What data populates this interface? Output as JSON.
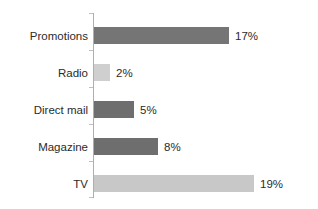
{
  "chart_data": {
    "type": "bar",
    "orientation": "horizontal",
    "title": "",
    "subtitle": "",
    "xlabel": "",
    "ylabel": "",
    "grid": false,
    "legend": "none",
    "xlim": [
      0,
      19
    ],
    "value_suffix": "%",
    "categories": [
      "Promotions",
      "Radio",
      "Direct mail",
      "Magazine",
      "TV"
    ],
    "values": [
      17,
      2,
      5,
      8,
      19
    ],
    "value_labels": [
      "17%",
      "2%",
      "5%",
      "8%",
      "19%"
    ],
    "bar_colors": [
      "#757575",
      "#cfcfcf",
      "#6e6e6e",
      "#6e6e6e",
      "#c8c8c8"
    ],
    "bars": [
      {
        "category": "Promotions",
        "value": 17,
        "label": "17%",
        "color": "#757575",
        "px_width": 135
      },
      {
        "category": "Radio",
        "value": 2,
        "label": "2%",
        "color": "#cfcfcf",
        "px_width": 16
      },
      {
        "category": "Direct mail",
        "value": 5,
        "label": "5%",
        "color": "#6e6e6e",
        "px_width": 40
      },
      {
        "category": "Magazine",
        "value": 8,
        "label": "8%",
        "color": "#6e6e6e",
        "px_width": 64
      },
      {
        "category": "TV",
        "value": 19,
        "label": "19%",
        "color": "#c8c8c8",
        "px_width": 160
      }
    ]
  },
  "axis": {
    "line_color": "#aeaeae",
    "tick_color": "#c0c0c0"
  }
}
